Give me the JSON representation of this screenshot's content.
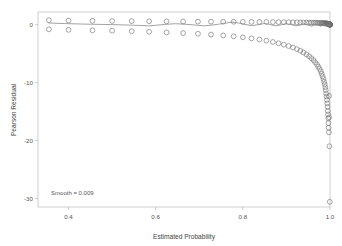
{
  "chart_data": {
    "type": "scatter",
    "title": "",
    "xlabel": "Estimated Probability",
    "ylabel": "Pearson Residual",
    "xlim": [
      0.33,
      1.0
    ],
    "ylim": [
      -31.5,
      2.2
    ],
    "xticks": [
      0.4,
      0.6,
      0.8,
      1.0
    ],
    "xtick_labels": [
      "0.4",
      "0.6",
      "0.8",
      "1.0"
    ],
    "yticks": [
      0,
      -10,
      -20,
      -30
    ],
    "ytick_labels": [
      "0",
      "-10",
      "-20",
      "-30"
    ],
    "grid": false,
    "legend": null,
    "annotations": [
      {
        "text": "Smooth = 0.009",
        "x": 0.36,
        "y": -29.4,
        "halign": "left"
      }
    ],
    "marker": {
      "shape": "open-circle",
      "size": 3.0,
      "edge_color": "#6f6f6f",
      "fill_color": "none"
    },
    "smoother": {
      "name": "loess-smooth",
      "color": "#8a8a8a",
      "width": 0.8,
      "parameter_label": "Smooth = 0.009",
      "points": [
        [
          0.355,
          0.3
        ],
        [
          0.39,
          0.2
        ],
        [
          0.43,
          0.12
        ],
        [
          0.47,
          0.06
        ],
        [
          0.5,
          0.02
        ],
        [
          0.53,
          -0.04
        ],
        [
          0.56,
          -0.12
        ],
        [
          0.585,
          -0.2
        ],
        [
          0.6,
          -0.1
        ],
        [
          0.62,
          0.05
        ],
        [
          0.645,
          0.18
        ],
        [
          0.665,
          0.1
        ],
        [
          0.69,
          -0.05
        ],
        [
          0.71,
          -0.18
        ],
        [
          0.725,
          -0.1
        ],
        [
          0.745,
          0.1
        ],
        [
          0.76,
          0.28
        ],
        [
          0.775,
          0.45
        ],
        [
          0.79,
          0.3
        ],
        [
          0.805,
          0.05
        ],
        [
          0.82,
          -0.15
        ],
        [
          0.835,
          0.0
        ],
        [
          0.85,
          0.22
        ],
        [
          0.862,
          0.05
        ],
        [
          0.875,
          -0.18
        ],
        [
          0.888,
          -0.02
        ],
        [
          0.9,
          0.18
        ],
        [
          0.912,
          0.0
        ],
        [
          0.922,
          -0.2
        ],
        [
          0.932,
          -0.05
        ],
        [
          0.941,
          0.15
        ],
        [
          0.95,
          -0.05
        ],
        [
          0.958,
          -0.25
        ],
        [
          0.964,
          -0.05
        ],
        [
          0.97,
          0.12
        ],
        [
          0.975,
          -0.1
        ],
        [
          0.979,
          -0.28
        ],
        [
          0.983,
          -0.1
        ],
        [
          0.986,
          0.08
        ],
        [
          0.989,
          -0.08
        ],
        [
          0.991,
          -0.22
        ],
        [
          0.993,
          -0.1
        ],
        [
          0.995,
          0.02
        ],
        [
          0.996,
          -0.1
        ],
        [
          0.997,
          -0.2
        ],
        [
          0.998,
          -0.12
        ],
        [
          0.9985,
          -0.05
        ],
        [
          0.999,
          -0.12
        ],
        [
          0.9995,
          -0.18
        ],
        [
          1.0,
          -0.22
        ]
      ]
    },
    "series": [
      {
        "name": "upper-band-residuals",
        "description": "Residuals for observed outcome = 1, small positive values",
        "points": [
          [
            0.355,
            0.78
          ],
          [
            0.4,
            0.72
          ],
          [
            0.455,
            0.68
          ],
          [
            0.5,
            0.65
          ],
          [
            0.545,
            0.62
          ],
          [
            0.585,
            0.6
          ],
          [
            0.625,
            0.58
          ],
          [
            0.663,
            0.56
          ],
          [
            0.697,
            0.54
          ],
          [
            0.727,
            0.53
          ],
          [
            0.755,
            0.52
          ],
          [
            0.779,
            0.51
          ],
          [
            0.8,
            0.5
          ],
          [
            0.82,
            0.49
          ],
          [
            0.838,
            0.48
          ],
          [
            0.854,
            0.47
          ],
          [
            0.869,
            0.46
          ],
          [
            0.882,
            0.45
          ],
          [
            0.894,
            0.44
          ],
          [
            0.905,
            0.43
          ],
          [
            0.915,
            0.42
          ],
          [
            0.924,
            0.41
          ],
          [
            0.932,
            0.4
          ],
          [
            0.939,
            0.39
          ],
          [
            0.946,
            0.38
          ],
          [
            0.952,
            0.37
          ],
          [
            0.957,
            0.36
          ],
          [
            0.962,
            0.35
          ],
          [
            0.966,
            0.34
          ],
          [
            0.97,
            0.33
          ],
          [
            0.973,
            0.32
          ],
          [
            0.976,
            0.31
          ],
          [
            0.979,
            0.3
          ],
          [
            0.981,
            0.29
          ],
          [
            0.983,
            0.28
          ],
          [
            0.985,
            0.27
          ],
          [
            0.9865,
            0.26
          ],
          [
            0.988,
            0.25
          ],
          [
            0.9892,
            0.24
          ],
          [
            0.9903,
            0.23
          ],
          [
            0.9913,
            0.22
          ],
          [
            0.9922,
            0.21
          ],
          [
            0.993,
            0.2
          ],
          [
            0.9937,
            0.19
          ],
          [
            0.9944,
            0.18
          ],
          [
            0.995,
            0.17
          ],
          [
            0.9955,
            0.16
          ],
          [
            0.996,
            0.15
          ],
          [
            0.9965,
            0.14
          ],
          [
            0.9969,
            0.13
          ],
          [
            0.9973,
            0.12
          ],
          [
            0.9976,
            0.11
          ],
          [
            0.9979,
            0.1
          ],
          [
            0.9982,
            0.09
          ],
          [
            0.9984,
            0.08
          ],
          [
            0.9986,
            0.07
          ],
          [
            0.9988,
            0.06
          ],
          [
            0.999,
            0.05
          ],
          [
            0.9992,
            0.04
          ],
          [
            0.9993,
            0.035
          ],
          [
            0.9994,
            0.03
          ],
          [
            0.9995,
            0.028
          ],
          [
            0.9996,
            0.025
          ],
          [
            0.9997,
            0.022
          ],
          [
            0.99975,
            0.02
          ],
          [
            0.9998,
            0.018
          ],
          [
            0.99985,
            0.015
          ],
          [
            0.9999,
            0.012
          ],
          [
            0.99993,
            0.01
          ],
          [
            0.99996,
            0.008
          ],
          [
            0.99998,
            0.006
          ],
          [
            1.0,
            0.004
          ]
        ]
      },
      {
        "name": "lower-band-residuals",
        "description": "Residuals for observed outcome = 0, grows increasingly negative as estimated probability approaches 1",
        "points": [
          [
            0.355,
            -0.8
          ],
          [
            0.4,
            -0.88
          ],
          [
            0.455,
            -0.96
          ],
          [
            0.5,
            -1.03
          ],
          [
            0.545,
            -1.12
          ],
          [
            0.585,
            -1.22
          ],
          [
            0.625,
            -1.32
          ],
          [
            0.663,
            -1.44
          ],
          [
            0.697,
            -1.56
          ],
          [
            0.727,
            -1.7
          ],
          [
            0.755,
            -1.85
          ],
          [
            0.779,
            -2.0
          ],
          [
            0.8,
            -2.18
          ],
          [
            0.82,
            -2.36
          ],
          [
            0.838,
            -2.56
          ],
          [
            0.854,
            -2.76
          ],
          [
            0.869,
            -2.98
          ],
          [
            0.882,
            -3.2
          ],
          [
            0.894,
            -3.44
          ],
          [
            0.905,
            -3.68
          ],
          [
            0.915,
            -3.94
          ],
          [
            0.924,
            -4.22
          ],
          [
            0.932,
            -4.5
          ],
          [
            0.939,
            -4.8
          ],
          [
            0.946,
            -5.12
          ],
          [
            0.952,
            -5.44
          ],
          [
            0.957,
            -5.78
          ],
          [
            0.962,
            -6.12
          ],
          [
            0.966,
            -6.48
          ],
          [
            0.97,
            -6.86
          ],
          [
            0.973,
            -7.24
          ],
          [
            0.976,
            -7.64
          ],
          [
            0.979,
            -8.05
          ],
          [
            0.981,
            -8.48
          ],
          [
            0.983,
            -8.92
          ],
          [
            0.985,
            -9.38
          ],
          [
            0.9865,
            -9.85
          ],
          [
            0.988,
            -10.3
          ],
          [
            0.9892,
            -10.8
          ],
          [
            0.9903,
            -11.3
          ],
          [
            0.9913,
            -11.9
          ],
          [
            0.9922,
            -12.4
          ],
          [
            0.993,
            -13.0
          ],
          [
            0.9937,
            -13.6
          ],
          [
            0.9944,
            -14.2
          ],
          [
            0.995,
            -14.9
          ],
          [
            0.9955,
            -15.5
          ],
          [
            0.996,
            -16.2
          ],
          [
            0.9965,
            -17.0
          ],
          [
            0.9969,
            -17.8
          ],
          [
            0.9973,
            -18.6
          ],
          [
            0.9978,
            -12.3
          ],
          [
            0.9982,
            -16.0
          ],
          [
            0.9986,
            -21.0
          ],
          [
            0.9995,
            -30.6
          ]
        ]
      }
    ]
  },
  "axis": {
    "y_title": "Pearson Residual",
    "x_title": "Estimated Probability"
  }
}
